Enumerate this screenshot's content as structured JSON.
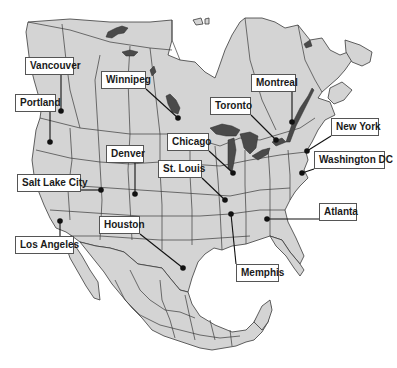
{
  "map": {
    "title": "North America city map",
    "colors": {
      "land": "#d4d4d4",
      "water": "#4a4a4a",
      "border": "#3a3a3a",
      "background": "#ffffff",
      "marker": "#111111"
    },
    "cities": [
      {
        "name": "Vancouver",
        "label_x": 25,
        "label_y": 57,
        "label_w": 49,
        "dot_x": 61,
        "dot_y": 111
      },
      {
        "name": "Portland",
        "label_x": 15,
        "label_y": 94,
        "label_w": 41,
        "dot_x": 50,
        "dot_y": 142
      },
      {
        "name": "Winnipeg",
        "label_x": 101,
        "label_y": 71,
        "label_w": 45,
        "dot_x": 178,
        "dot_y": 118
      },
      {
        "name": "Montreal",
        "label_x": 251,
        "label_y": 74,
        "label_w": 45,
        "dot_x": 292,
        "dot_y": 122
      },
      {
        "name": "Toronto",
        "label_x": 210,
        "label_y": 97,
        "label_w": 41,
        "dot_x": 276,
        "dot_y": 140
      },
      {
        "name": "Chicago",
        "label_x": 167,
        "label_y": 133,
        "label_w": 42,
        "dot_x": 233,
        "dot_y": 173
      },
      {
        "name": "New York",
        "label_x": 331,
        "label_y": 118,
        "label_w": 48,
        "dot_x": 307,
        "dot_y": 151
      },
      {
        "name": "Washington DC",
        "label_x": 314,
        "label_y": 151,
        "label_w": 71,
        "dot_x": 302,
        "dot_y": 173
      },
      {
        "name": "Denver",
        "label_x": 106,
        "label_y": 145,
        "label_w": 38,
        "dot_x": 135,
        "dot_y": 194
      },
      {
        "name": "St. Louis",
        "label_x": 158,
        "label_y": 160,
        "label_w": 44,
        "dot_x": 225,
        "dot_y": 200
      },
      {
        "name": "Salt Lake City",
        "label_x": 17,
        "label_y": 174,
        "label_w": 64,
        "dot_x": 101,
        "dot_y": 190
      },
      {
        "name": "Atlanta",
        "label_x": 319,
        "label_y": 203,
        "label_w": 38,
        "dot_x": 267,
        "dot_y": 219
      },
      {
        "name": "Los Angeles",
        "label_x": 15,
        "label_y": 236,
        "label_w": 59,
        "dot_x": 60,
        "dot_y": 221
      },
      {
        "name": "Houston",
        "label_x": 99,
        "label_y": 216,
        "label_w": 41,
        "dot_x": 183,
        "dot_y": 268
      },
      {
        "name": "Memphis",
        "label_x": 236,
        "label_y": 264,
        "label_w": 43,
        "dot_x": 231,
        "dot_y": 214
      }
    ]
  }
}
